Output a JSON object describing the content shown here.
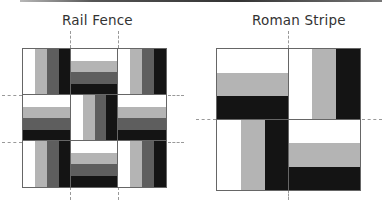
{
  "header": {
    "rule": "top-divider"
  },
  "colors": {
    "white": "#ffffff",
    "light": "#b4b4b4",
    "mid": "#5e5e5e",
    "dark": "#141414",
    "outline": "#555555",
    "guide": "#999999"
  },
  "rail_fence": {
    "title": "Rail Fence",
    "grid": "3x3",
    "cell_orientation": [
      [
        "vertical",
        "horizontal",
        "vertical"
      ],
      [
        "horizontal",
        "vertical",
        "horizontal"
      ],
      [
        "vertical",
        "horizontal",
        "vertical"
      ]
    ],
    "stripes": [
      "white",
      "light",
      "mid",
      "dark"
    ]
  },
  "roman_stripe": {
    "title": "Roman Stripe",
    "grid": "2x2",
    "cell_orientation": [
      [
        "horizontal",
        "vertical"
      ],
      [
        "vertical",
        "horizontal"
      ]
    ],
    "stripes": [
      "white",
      "light",
      "dark"
    ]
  }
}
